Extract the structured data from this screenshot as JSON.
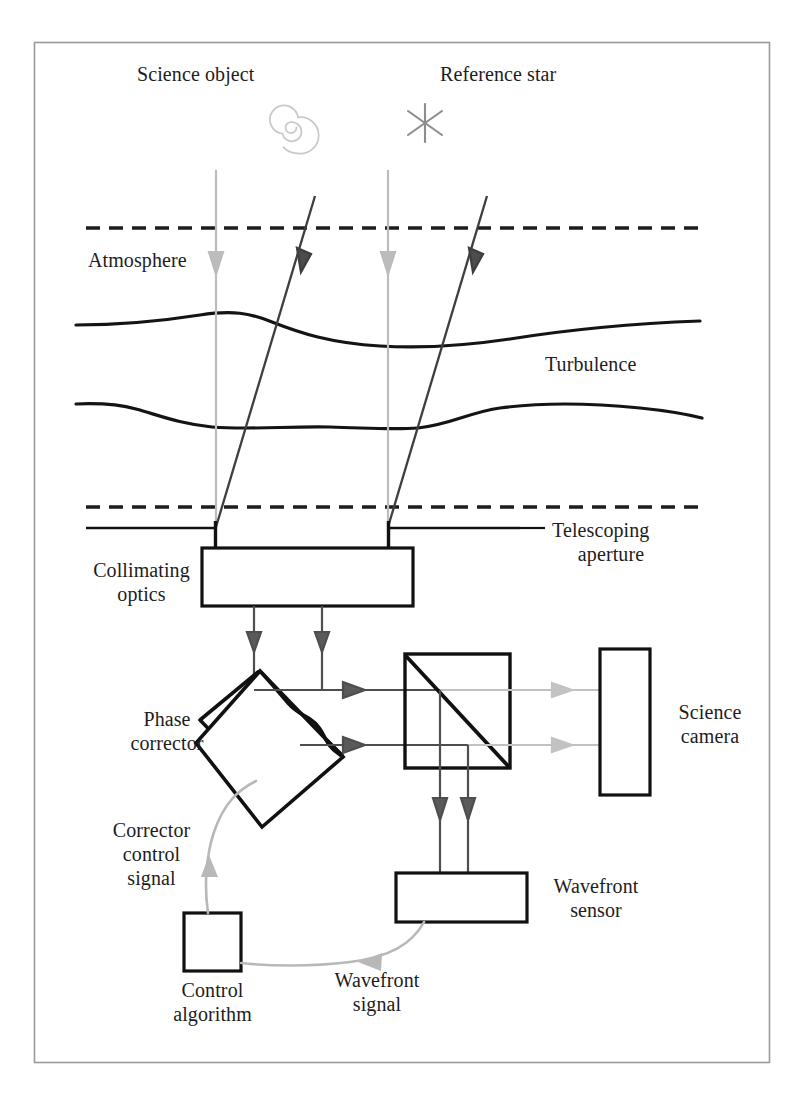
{
  "figure": {
    "frame_color": "#9a9a9a",
    "background": "#ffffff"
  },
  "colors": {
    "ink": "#1d1d1d",
    "dark_ray": "#4a4a4a",
    "light_ray": "#b8b8b8",
    "mid_gray": "#7d7d7d",
    "signal_curve": "#b5b5b5",
    "spiral_icon": "#c9c9c9",
    "star_icon": "#8f8f8f",
    "box_stroke": "#111111"
  },
  "sources": {
    "science_object": {
      "label": "Science object",
      "icon": "spiral-galaxy-icon",
      "icon_color": "#c9c9c9",
      "label_x": 210,
      "label_y": 62
    },
    "reference_star": {
      "label": "Reference star",
      "icon": "star-asterisk-icon",
      "icon_color": "#8f8f8f",
      "label_x": 510,
      "label_y": 62
    }
  },
  "layers": {
    "atmosphere": {
      "label": "Atmosphere",
      "top_boundary_y": 228,
      "bottom_boundary_y": 507,
      "boundary_style": "dashed",
      "label_x": 88,
      "label_y": 248
    },
    "turbulence": {
      "label": "Turbulence",
      "wave_upper_y": 325,
      "wave_lower_y": 409,
      "label_x": 540,
      "label_y": 352
    }
  },
  "components": [
    {
      "name": "telescoping-aperture",
      "label_line1": "Telescoping",
      "label_line2": "aperture",
      "label_x": 540,
      "label_y": 518,
      "shape": "aperture-bars",
      "y": 528,
      "gap_left_x": 216,
      "gap_right_x": 388
    },
    {
      "name": "collimating-optics",
      "label_line1": "Collimating",
      "label_line2": "optics",
      "label_x": 85,
      "label_y": 558,
      "shape": "rect",
      "x": 202,
      "y": 548,
      "w": 211,
      "h": 58
    },
    {
      "name": "phase-corrector",
      "label_line1": "Phase",
      "label_line2": "corrector",
      "label_x": 118,
      "label_y": 707,
      "shape": "rotated-square-wavy-edge",
      "cx": 272,
      "cy": 742,
      "half": 72
    },
    {
      "name": "beam-splitter",
      "label": "",
      "shape": "square-with-diagonal",
      "x": 405,
      "y": 654,
      "w": 105,
      "h": 114
    },
    {
      "name": "science-camera",
      "label_line1": "Science",
      "label_line2": "camera",
      "label_x": 667,
      "label_y": 700,
      "shape": "rect",
      "x": 600,
      "y": 649,
      "w": 50,
      "h": 146
    },
    {
      "name": "wavefront-sensor",
      "label_line1": "Wavefront",
      "label_line2": "sensor",
      "label_x": 537,
      "label_y": 874,
      "shape": "rect",
      "x": 396,
      "y": 873,
      "w": 131,
      "h": 49
    },
    {
      "name": "control-algorithm",
      "label_line1": "Control",
      "label_line2": "algorithm",
      "label_x": 165,
      "label_y": 978,
      "shape": "rect",
      "x": 184,
      "y": 913,
      "w": 57,
      "h": 58
    }
  ],
  "signals": [
    {
      "name": "wavefront-signal",
      "label_line1": "Wavefront",
      "label_line2": "signal",
      "label_x": 325,
      "label_y": 968,
      "from": "wavefront-sensor",
      "to": "control-algorithm",
      "color": "#b5b5b5"
    },
    {
      "name": "corrector-control-signal",
      "label_line1": "Corrector",
      "label_line2": "control",
      "label_line3": "signal",
      "label_x": 107,
      "label_y": 818,
      "from": "control-algorithm",
      "to": "phase-corrector",
      "color": "#b5b5b5"
    }
  ],
  "rays": {
    "science_vertical_x": [
      216,
      388
    ],
    "science_color": "#b8b8b8",
    "reference_color": "#4a4a4a",
    "reference_top_x": [
      315,
      487
    ],
    "reference_bottom_x": [
      216,
      388
    ],
    "collimated_beam_x": [
      254,
      322
    ],
    "horizontal_beam_y": [
      690,
      745
    ]
  }
}
